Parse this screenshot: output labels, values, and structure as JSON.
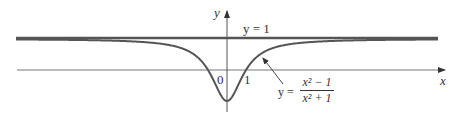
{
  "figure": {
    "labels": {
      "y_axis": "y",
      "x_axis": "x",
      "origin": "0",
      "x_tick_1": "1",
      "asymptote": "y = 1",
      "equation_lhs": "y =",
      "equation_num": "x² − 1",
      "equation_den": "x² + 1"
    },
    "colors": {
      "curve": "#555555",
      "asymptote": "#555555",
      "axes": "#666666",
      "text": "#333333"
    }
  },
  "chart_data": {
    "type": "line",
    "title": "",
    "function": "y = (x^2 - 1)/(x^2 + 1)",
    "xlabel": "x",
    "ylabel": "y",
    "asymptote": {
      "y": 1,
      "label": "y = 1"
    },
    "ticks": {
      "x": [
        "0",
        "1"
      ]
    },
    "key_points": [
      {
        "x": 0,
        "y": -1,
        "note": "minimum"
      },
      {
        "x": -1,
        "y": 0
      },
      {
        "x": 1,
        "y": 0
      }
    ],
    "series": [
      {
        "name": "y = (x^2 - 1)/(x^2 + 1)",
        "x": [
          -10,
          -5,
          -3,
          -2,
          -1.5,
          -1,
          -0.5,
          0,
          0.5,
          1,
          1.5,
          2,
          3,
          5,
          10
        ],
        "values": [
          0.98,
          0.923,
          0.8,
          0.6,
          0.385,
          0,
          -0.6,
          -1,
          -0.6,
          0,
          0.385,
          0.6,
          0.8,
          0.923,
          0.98
        ]
      }
    ],
    "grid": false,
    "legend": "none"
  }
}
